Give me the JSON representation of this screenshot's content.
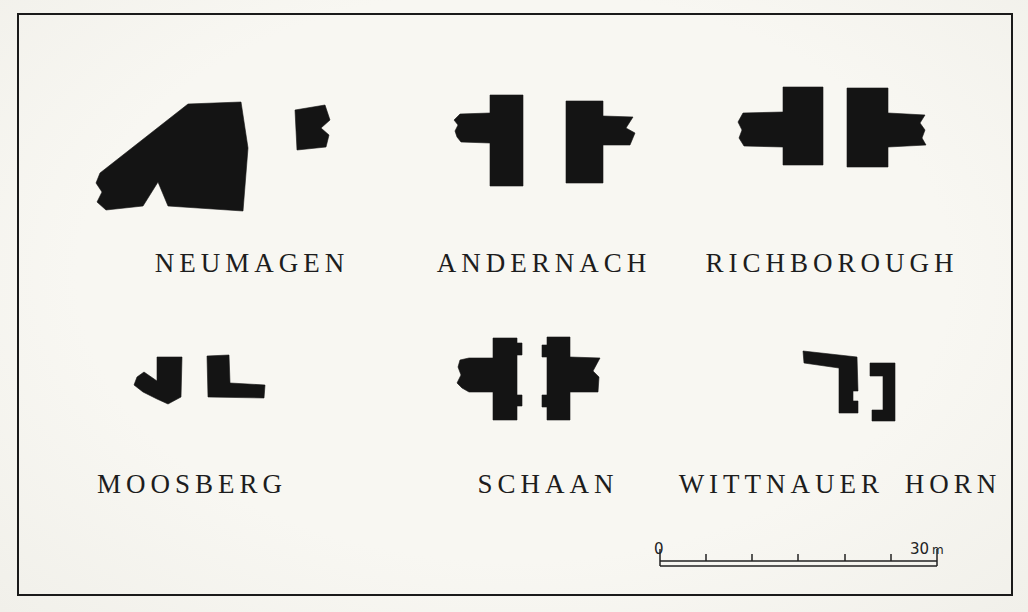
{
  "figure": {
    "type": "archaeological-gate-plans",
    "plans": [
      {
        "id": "neumagen",
        "label": "NEUMAGEN"
      },
      {
        "id": "andernach",
        "label": "ANDERNACH"
      },
      {
        "id": "richborough",
        "label": "RICHBOROUGH"
      },
      {
        "id": "moosberg",
        "label": "MOOSBERG"
      },
      {
        "id": "schaan",
        "label": "SCHAAN"
      },
      {
        "id": "wittnauer-horn",
        "label": "WITTNAUER HORN"
      }
    ],
    "scale_bar": {
      "start_label": "0",
      "end_value": "30",
      "unit": "m",
      "divisions": 6,
      "length_meters": 30
    },
    "colors": {
      "ink": "#141414",
      "paper": "#f6f5f0"
    }
  }
}
